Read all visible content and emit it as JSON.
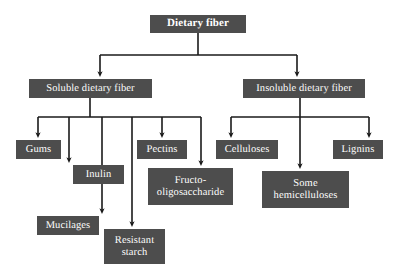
{
  "diagram": {
    "type": "tree",
    "orientation": "top-down",
    "colors": {
      "node_fill": "#4d4d4d",
      "node_text": "#ffffff",
      "connector": "#1a1a1a",
      "background": "#ffffff"
    },
    "nodes": {
      "root": {
        "label": "Dietary fiber",
        "level": 0,
        "x": 150,
        "y": 15,
        "w": 96,
        "h": 18,
        "font_size": 11,
        "bold": true
      },
      "soluble": {
        "label": "Soluble dietary fiber",
        "level": 1,
        "x": 29,
        "y": 79,
        "w": 123,
        "h": 19,
        "font_size": 10.5,
        "bold": false
      },
      "insoluble": {
        "label": "Insoluble dietary fiber",
        "level": 1,
        "x": 243,
        "y": 79,
        "w": 122,
        "h": 19,
        "font_size": 10.5,
        "bold": false
      },
      "gums": {
        "label": "Gums",
        "level": 2,
        "parent": "soluble",
        "x": 16,
        "y": 140,
        "w": 45,
        "h": 19,
        "font_size": 10.5,
        "bold": false
      },
      "inulin": {
        "label": "Inulin",
        "level": 2,
        "parent": "soluble",
        "x": 73,
        "y": 165,
        "w": 51,
        "h": 19,
        "font_size": 10.5,
        "bold": false
      },
      "mucilages": {
        "label": "Mucilages",
        "level": 2,
        "parent": "soluble",
        "x": 37,
        "y": 216,
        "w": 62,
        "h": 19,
        "font_size": 10.5,
        "bold": false
      },
      "resistant_starch": {
        "label": "Resistant\nstarch",
        "level": 2,
        "parent": "soluble",
        "x": 104,
        "y": 229,
        "w": 61,
        "h": 35,
        "font_size": 10.5,
        "bold": false
      },
      "pectins": {
        "label": "Pectins",
        "level": 2,
        "parent": "soluble",
        "x": 137,
        "y": 140,
        "w": 50,
        "h": 19,
        "font_size": 10.5,
        "bold": false
      },
      "fructo_oligosaccharide": {
        "label": "Fructo-\noligosaccharide",
        "level": 2,
        "parent": "soluble",
        "x": 148,
        "y": 168,
        "w": 85,
        "h": 37,
        "font_size": 10.5,
        "bold": false
      },
      "celluloses": {
        "label": "Celluloses",
        "level": 2,
        "parent": "insoluble",
        "x": 216,
        "y": 140,
        "w": 62,
        "h": 19,
        "font_size": 10.5,
        "bold": false
      },
      "some_hemicelluloses": {
        "label": "Some\nhemicelluloses",
        "level": 2,
        "parent": "insoluble",
        "x": 262,
        "y": 171,
        "w": 87,
        "h": 37,
        "font_size": 10.5,
        "bold": false
      },
      "lignins": {
        "label": "Lignins",
        "level": 2,
        "parent": "insoluble",
        "x": 333,
        "y": 140,
        "w": 50,
        "h": 19,
        "font_size": 10.5,
        "bold": false
      }
    },
    "edges": [
      {
        "from": "root",
        "to": "soluble"
      },
      {
        "from": "root",
        "to": "insoluble"
      },
      {
        "from": "soluble",
        "to": "gums"
      },
      {
        "from": "soluble",
        "to": "inulin"
      },
      {
        "from": "soluble",
        "to": "mucilages"
      },
      {
        "from": "soluble",
        "to": "resistant_starch"
      },
      {
        "from": "soluble",
        "to": "pectins"
      },
      {
        "from": "soluble",
        "to": "fructo_oligosaccharide"
      },
      {
        "from": "insoluble",
        "to": "celluloses"
      },
      {
        "from": "insoluble",
        "to": "some_hemicelluloses"
      },
      {
        "from": "insoluble",
        "to": "lignins"
      }
    ]
  }
}
